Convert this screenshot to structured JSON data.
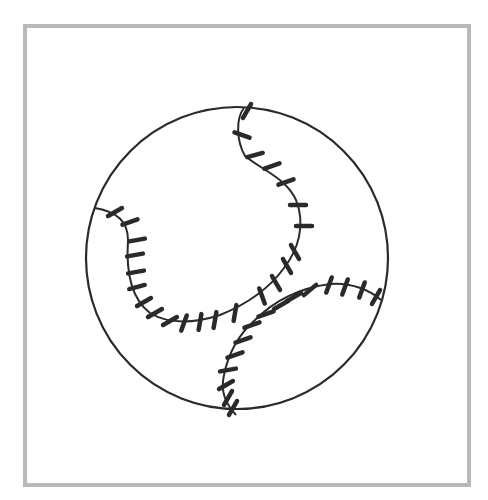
{
  "illustration": {
    "subject": "baseball",
    "frame_color": "#b9b9b9",
    "ink_color": "#2a2a2a",
    "ball": {
      "cx": 237,
      "cy": 258,
      "r": 151
    },
    "seams": [
      {
        "name": "upper-left-seam",
        "path": "M 244 108 C 236 118, 236 140, 245 156 C 262 170, 286 178, 296 200 C 306 225, 298 250, 284 268 C 268 290, 245 305, 220 315 C 195 323, 170 325, 150 313 C 130 298, 126 270, 128 240 C 128 222, 118 212, 95 208",
        "stitches": [
          [
            247,
            111,
            -60
          ],
          [
            242,
            135,
            20
          ],
          [
            255,
            155,
            -15
          ],
          [
            272,
            166,
            -20
          ],
          [
            286,
            182,
            -20
          ],
          [
            298,
            205,
            0
          ],
          [
            304,
            226,
            0
          ],
          [
            295,
            252,
            60
          ],
          [
            287,
            266,
            60
          ],
          [
            276,
            283,
            60
          ],
          [
            262,
            296,
            70
          ],
          [
            235,
            313,
            -80
          ],
          [
            215,
            320,
            -80
          ],
          [
            200,
            322,
            -80
          ],
          [
            184,
            323,
            -70
          ],
          [
            170,
            321,
            -30
          ],
          [
            155,
            313,
            -30
          ],
          [
            144,
            302,
            -30
          ],
          [
            137,
            287,
            -15
          ],
          [
            136,
            272,
            -10
          ],
          [
            135,
            255,
            -10
          ],
          [
            137,
            240,
            -10
          ],
          [
            130,
            222,
            -20
          ],
          [
            115,
            212,
            -30
          ]
        ]
      },
      {
        "name": "lower-right-seam",
        "path": "M 381 300 C 370 290, 350 282, 330 284 C 300 288, 275 300, 255 320 C 238 335, 228 355, 224 375 C 220 392, 226 404, 236 415",
        "stitches": [
          [
            376,
            297,
            -60
          ],
          [
            362,
            290,
            -70
          ],
          [
            345,
            287,
            -70
          ],
          [
            329,
            285,
            -70
          ],
          [
            310,
            290,
            -40
          ],
          [
            294,
            297,
            -30
          ],
          [
            281,
            305,
            -30
          ],
          [
            266,
            314,
            -20
          ],
          [
            252,
            325,
            -20
          ],
          [
            243,
            340,
            -20
          ],
          [
            235,
            355,
            -20
          ],
          [
            228,
            370,
            -10
          ],
          [
            226,
            385,
            -30
          ],
          [
            228,
            398,
            -60
          ],
          [
            233,
            408,
            -60
          ]
        ]
      }
    ]
  }
}
